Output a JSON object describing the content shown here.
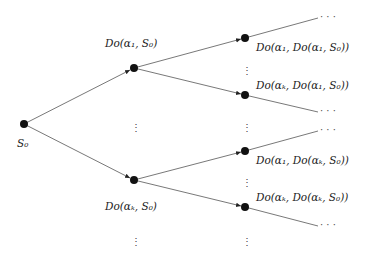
{
  "diagram": {
    "type": "situation-tree",
    "nodes": {
      "root": {
        "label": "S0",
        "display": "S₀"
      },
      "l1_top": {
        "label": "Do(α1, S0)",
        "display": "Do(α₁, S₀)"
      },
      "l1_bottom": {
        "label": "Do(αk, S0)",
        "display": "Do(αₖ, S₀)"
      },
      "l2_1": {
        "label": "Do(α1, Do(α1, S0))",
        "display": "Do(α₁, Do(α₁, S₀))"
      },
      "l2_2": {
        "label": "Do(αk, Do(α1, S0))",
        "display": "Do(αₖ, Do(α₁, S₀))"
      },
      "l2_3": {
        "label": "Do(α1, Do(αk, S0))",
        "display": "Do(α₁, Do(αₖ, S₀))"
      },
      "l2_4": {
        "label": "Do(αk, Do(αk, S0))",
        "display": "Do(αₖ, Do(αₖ, S₀))"
      }
    },
    "ellipsis_h": "· · ·",
    "ellipsis_v": "⋮",
    "edges": [
      [
        "root",
        "l1_top"
      ],
      [
        "root",
        "l1_bottom"
      ],
      [
        "l1_top",
        "l2_1"
      ],
      [
        "l1_top",
        "l2_2"
      ],
      [
        "l1_bottom",
        "l2_3"
      ],
      [
        "l1_bottom",
        "l2_4"
      ],
      [
        "l2_1",
        "…"
      ],
      [
        "l2_2",
        "…"
      ],
      [
        "l2_3",
        "…"
      ],
      [
        "l2_4",
        "…"
      ]
    ]
  }
}
